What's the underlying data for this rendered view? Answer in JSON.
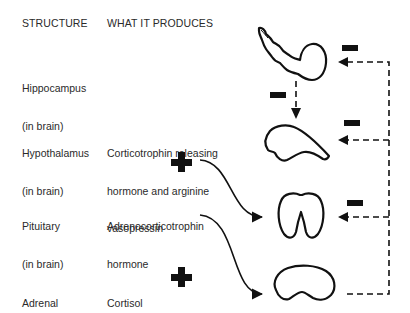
{
  "headers": {
    "structure": "STRUCTURE",
    "produces": "WHAT IT PRODUCES"
  },
  "rows": [
    {
      "structure_line1": "Hippocampus",
      "structure_line2": "(in brain)",
      "product_line1": "",
      "product_line2": "",
      "product_line3": ""
    },
    {
      "structure_line1": "Hypothalamus",
      "structure_line2": "(in brain)",
      "product_line1": "Corticotrophin releasing",
      "product_line2": "hormone and arginine",
      "product_line3": "vasopressin"
    },
    {
      "structure_line1": "Pituitary",
      "structure_line2": "(in brain)",
      "product_line1": "Adrenocorticotrophin",
      "product_line2": "hormone",
      "product_line3": ""
    },
    {
      "structure_line1": "Adrenal",
      "structure_line2": "",
      "product_line1": "Cortisol",
      "product_line2": "",
      "product_line3": ""
    }
  ],
  "symbols": {
    "stimulation": "plus",
    "inhibition": "minus"
  },
  "colors": {
    "ink": "#111111",
    "text": "#2a2a2a",
    "background": "#ffffff"
  }
}
